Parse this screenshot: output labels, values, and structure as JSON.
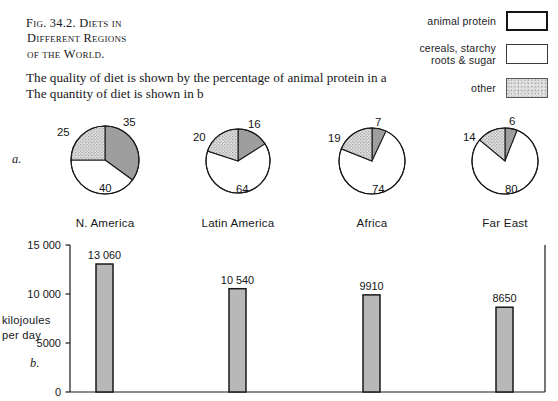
{
  "figure": {
    "title_lines": [
      "Fig. 34.2. Diets in",
      "Different Regions",
      "of the World."
    ],
    "caption_lines": [
      "The quality of diet is shown by the percentage of animal protein in a",
      "The quantity of diet is shown in b"
    ],
    "panel_a_marker": "a.",
    "panel_b_marker": "b."
  },
  "legend": {
    "items": [
      {
        "label": "animal protein",
        "swatch": "dark-gray-box",
        "style": "thick"
      },
      {
        "label": "cereals, starchy\nroots & sugar",
        "swatch": "white-box",
        "style": "thin"
      },
      {
        "label": "other",
        "swatch": "stippled-box",
        "style": "stipple"
      }
    ]
  },
  "colors": {
    "animal_protein": "#9e9e9e",
    "cereals": "#ffffff",
    "other_stipple": "#e0e0e0",
    "bar_fill": "#b8b8b8",
    "outline": "#1a1a1a"
  },
  "chart_data": [
    {
      "type": "pie",
      "title": "Diet composition by region (percentage)",
      "legend_position": "top-right",
      "categories": [
        "animal protein",
        "cereals, starchy roots & sugar",
        "other"
      ],
      "charts": [
        {
          "region": "N. America",
          "values": [
            35,
            40,
            25
          ],
          "labels": [
            "35",
            "40",
            "25"
          ]
        },
        {
          "region": "Latin America",
          "values": [
            16,
            64,
            20
          ],
          "labels": [
            "16",
            "64",
            "20"
          ]
        },
        {
          "region": "Africa",
          "values": [
            7,
            74,
            19
          ],
          "labels": [
            "7",
            "74",
            "19"
          ]
        },
        {
          "region": "Far East",
          "values": [
            6,
            80,
            14
          ],
          "labels": [
            "6",
            "80",
            "14"
          ]
        }
      ]
    },
    {
      "type": "bar",
      "title": "Quantity of diet",
      "categories": [
        "N. America",
        "Latin America",
        "Africa",
        "Far East"
      ],
      "values": [
        13060,
        10540,
        9910,
        8650
      ],
      "value_labels": [
        "13 060",
        "10 540",
        "9910",
        "8650"
      ],
      "xlabel": "",
      "ylabel": "kilojoules\nper day",
      "ylim": [
        0,
        15000
      ],
      "yticks": [
        0,
        5000,
        10000,
        15000
      ],
      "ytick_labels": [
        "0",
        "5000",
        "10 000",
        "15 000"
      ],
      "grid": false
    }
  ],
  "axis": {
    "y_title_line1": "kilojoules",
    "y_title_line2": "per day"
  }
}
